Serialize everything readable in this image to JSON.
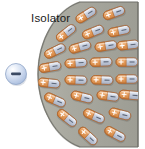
{
  "figure": {
    "title_label": "Isolator",
    "width": 145,
    "height": 149,
    "background_color": "#ffffff"
  },
  "charge": {
    "name": "point-charge",
    "sign": "−",
    "polarity": "negative",
    "cx": 16,
    "cy": 74,
    "r": 10.5,
    "fill_color": "#c3d2ec",
    "highlight_color": "#ffffff",
    "edge_color": "#8fa4c6",
    "sign_color": "#3b4a63"
  },
  "slab": {
    "name": "dielectric-slab",
    "fill_color": "#a9a9a0",
    "edge_color": "#6f6f68",
    "shade_color": "#8e8e86",
    "right_edge_x": 138,
    "arc_apex_x": 38,
    "arc_apex_y": 74,
    "top_y": 2,
    "bottom_y": 147
  },
  "dipole_style": {
    "plus_color": "#e8a060",
    "plus_edge": "#b4682c",
    "minus_color": "#c6cede",
    "minus_edge": "#7d8598",
    "body_length": 22,
    "body_height": 8.5,
    "plus_sign": "+",
    "minus_sign": "−"
  },
  "dipoles": [
    {
      "id": 1,
      "cx": 86,
      "cy": 15,
      "angle": -32
    },
    {
      "id": 2,
      "cx": 114,
      "cy": 13,
      "angle": -20
    },
    {
      "id": 3,
      "cx": 66,
      "cy": 33,
      "angle": -38
    },
    {
      "id": 4,
      "cx": 93,
      "cy": 32,
      "angle": -22
    },
    {
      "id": 5,
      "cx": 119,
      "cy": 31,
      "angle": -12
    },
    {
      "id": 6,
      "cx": 55,
      "cy": 51,
      "angle": -26
    },
    {
      "id": 7,
      "cx": 80,
      "cy": 47,
      "angle": -16
    },
    {
      "id": 8,
      "cx": 106,
      "cy": 46,
      "angle": -9
    },
    {
      "id": 9,
      "cx": 128,
      "cy": 45,
      "angle": -6
    },
    {
      "id": 10,
      "cx": 50,
      "cy": 67,
      "angle": -10
    },
    {
      "id": 11,
      "cx": 76,
      "cy": 63,
      "angle": -4
    },
    {
      "id": 12,
      "cx": 101,
      "cy": 62,
      "angle": -2
    },
    {
      "id": 13,
      "cx": 127,
      "cy": 62,
      "angle": 0
    },
    {
      "id": 14,
      "cx": 49,
      "cy": 83,
      "angle": 6
    },
    {
      "id": 15,
      "cx": 76,
      "cy": 80,
      "angle": 2
    },
    {
      "id": 16,
      "cx": 102,
      "cy": 80,
      "angle": 2
    },
    {
      "id": 17,
      "cx": 127,
      "cy": 79,
      "angle": 0
    },
    {
      "id": 18,
      "cx": 55,
      "cy": 100,
      "angle": 24
    },
    {
      "id": 19,
      "cx": 82,
      "cy": 97,
      "angle": 14
    },
    {
      "id": 20,
      "cx": 108,
      "cy": 96,
      "angle": 8
    },
    {
      "id": 21,
      "cx": 130,
      "cy": 95,
      "angle": 5
    },
    {
      "id": 22,
      "cx": 67,
      "cy": 118,
      "angle": 38
    },
    {
      "id": 23,
      "cx": 94,
      "cy": 116,
      "angle": 24
    },
    {
      "id": 24,
      "cx": 120,
      "cy": 114,
      "angle": 14
    },
    {
      "id": 25,
      "cx": 88,
      "cy": 136,
      "angle": 42
    },
    {
      "id": 26,
      "cx": 115,
      "cy": 134,
      "angle": 28
    }
  ]
}
